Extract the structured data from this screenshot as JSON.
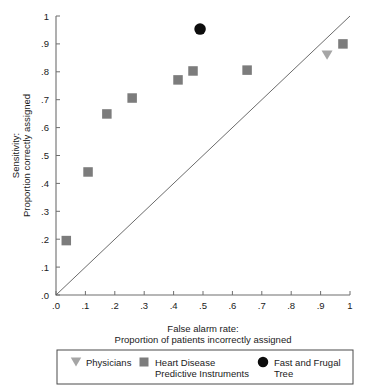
{
  "chart_data": {
    "type": "scatter",
    "title": "",
    "xlabel": "False alarm rate:\nProportion of patients incorrectly assigned",
    "xlabel_line1": "False alarm rate:",
    "xlabel_line2": "Proportion of patients incorrectly assigned",
    "ylabel": "Sensitivity:\nProportion correctly assigned",
    "ylabel_line1": "Sensitivity:",
    "ylabel_line2": "Proportion correctly assigned",
    "xlim": [
      0,
      1
    ],
    "ylim": [
      0,
      1
    ],
    "grid": false,
    "xticks": [
      0,
      0.1,
      0.2,
      0.3,
      0.4,
      0.5,
      0.6,
      0.7,
      0.8,
      0.9,
      1
    ],
    "yticks": [
      0,
      0.1,
      0.2,
      0.3,
      0.4,
      0.5,
      0.6,
      0.7,
      0.8,
      0.9,
      1
    ],
    "xtick_labels": [
      ".0",
      ".1",
      ".2",
      ".3",
      ".4",
      ".5",
      ".6",
      ".7",
      ".8",
      ".9",
      "1"
    ],
    "ytick_labels": [
      ".0",
      ".1",
      ".2",
      ".3",
      ".4",
      ".5",
      ".6",
      ".7",
      ".8",
      ".9",
      "1"
    ],
    "reference_line": {
      "name": "chance-diagonal",
      "from": [
        0,
        0
      ],
      "to": [
        1,
        1
      ]
    },
    "legend_position": "bottom",
    "series": [
      {
        "name": "Heart Disease Predictive Instruments",
        "marker": "square",
        "color": "#7c7c7c",
        "points": [
          {
            "x": 0.035,
            "y": 0.195
          },
          {
            "x": 0.109,
            "y": 0.441
          },
          {
            "x": 0.173,
            "y": 0.649
          },
          {
            "x": 0.259,
            "y": 0.706
          },
          {
            "x": 0.415,
            "y": 0.771
          },
          {
            "x": 0.466,
            "y": 0.803
          },
          {
            "x": 0.65,
            "y": 0.806
          },
          {
            "x": 0.976,
            "y": 0.9
          }
        ]
      },
      {
        "name": "Physicians",
        "marker": "triangle-down",
        "color": "#a5a5a5",
        "points": [
          {
            "x": 0.922,
            "y": 0.86
          }
        ]
      },
      {
        "name": "Fast and Frugal Tree",
        "marker": "circle",
        "color": "#0d0d0d",
        "points": [
          {
            "x": 0.49,
            "y": 0.953
          }
        ]
      }
    ]
  },
  "legend": {
    "items": [
      {
        "label": "Physicians",
        "label_line2": "",
        "marker": "triangle-down",
        "color": "#a5a5a5"
      },
      {
        "label": "Heart Disease",
        "label_line2": "Predictive Instruments",
        "marker": "square",
        "color": "#7c7c7c"
      },
      {
        "label": "Fast and Frugal",
        "label_line2": "Tree",
        "marker": "circle",
        "color": "#0d0d0d"
      }
    ]
  }
}
